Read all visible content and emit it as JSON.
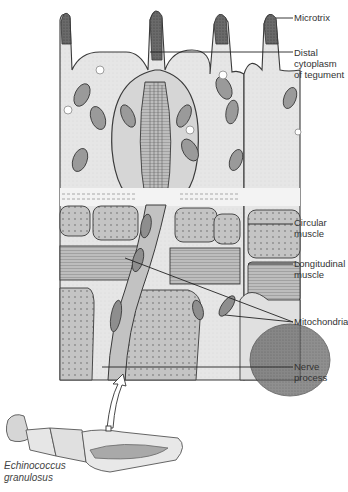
{
  "figure": {
    "organism": "Echinococcus granulosus",
    "caption_lines": [
      "Echinococcus",
      "granulosus"
    ],
    "labels": [
      {
        "id": "microtrix",
        "lines": [
          "Microtrix"
        ]
      },
      {
        "id": "distal-cytoplasm",
        "lines": [
          "Distal cytoplasm",
          "of tegument"
        ]
      },
      {
        "id": "circular-muscle",
        "lines": [
          "Circular",
          "muscle"
        ]
      },
      {
        "id": "longitudinal-muscle",
        "lines": [
          "Longitudinal",
          "muscle"
        ]
      },
      {
        "id": "mitochondria",
        "lines": [
          "Mitochondria"
        ]
      },
      {
        "id": "nerve-process",
        "lines": [
          "Nerve process"
        ]
      }
    ],
    "colors": {
      "tegument": "#e3e3e3",
      "muscle": "#b8b8b8",
      "outline": "#3a3a3a",
      "microtrix_tip": "#4a4a4a",
      "label_text": "#333333"
    }
  }
}
